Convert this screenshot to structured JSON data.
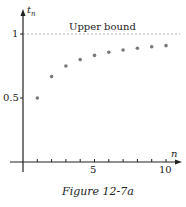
{
  "figure": {
    "caption": "Figure 12-7a",
    "annotation": "Upper bound",
    "xlabel": "n",
    "ylabel": "t",
    "ylabel_sub": "n",
    "y_ticks": [
      "1",
      "0.5"
    ],
    "x_ticks": [
      "5",
      "10"
    ]
  },
  "chart_data": {
    "type": "scatter",
    "title": "",
    "xlabel": "n",
    "ylabel": "t_n",
    "x": [
      1,
      2,
      3,
      4,
      5,
      6,
      7,
      8,
      9,
      10
    ],
    "values": [
      0.5,
      0.667,
      0.75,
      0.8,
      0.833,
      0.857,
      0.875,
      0.889,
      0.9,
      0.909
    ],
    "annotations": [
      {
        "type": "hline",
        "y": 1,
        "style": "dashed",
        "label": "Upper bound"
      }
    ],
    "xlim": [
      0,
      10.5
    ],
    "ylim": [
      0,
      1.1
    ],
    "grid": false,
    "caption": "Figure 12-7a",
    "point_color": "#7a7a7a"
  }
}
